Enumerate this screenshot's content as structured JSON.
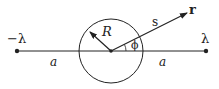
{
  "diagram": {
    "labels": {
      "left_charge": "−λ",
      "right_charge": "λ",
      "left_distance": "a",
      "right_distance": "a",
      "radius": "R",
      "separation": "s",
      "field_point": "r",
      "angle": "ϕ"
    },
    "colors": {
      "stroke": "#222222",
      "background": "#ffffff"
    }
  }
}
